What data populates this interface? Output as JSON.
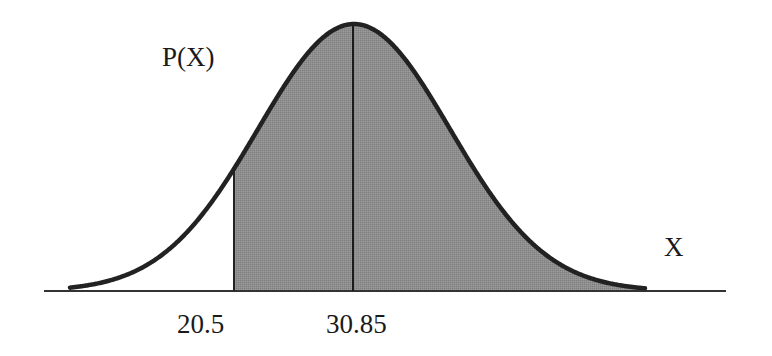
{
  "chart_data": {
    "type": "area",
    "title": "",
    "ylabel": "P(X)",
    "xlabel": "X",
    "distribution": "normal",
    "mean": 30.85,
    "markers": [
      {
        "x": 20.5,
        "label": "20.5",
        "role": "shading-boundary"
      },
      {
        "x": 30.85,
        "label": "30.85",
        "role": "mean"
      }
    ],
    "shaded_region": {
      "from": 20.5,
      "to": "right tail",
      "color": "#8c8c8c"
    },
    "grid": false,
    "legend": null
  },
  "labels": {
    "y_axis": "P(X)",
    "x_axis": "X",
    "tick_left": "20.5",
    "tick_mean": "30.85"
  },
  "colors": {
    "curve": "#222222",
    "shade": "#8c8c8c",
    "axis": "#333333",
    "background": "#ffffff"
  },
  "geometry": {
    "axis_y": 291,
    "axis_x_start": 44,
    "axis_x_end": 726,
    "curve_x_start": 70,
    "curve_x_end": 645,
    "peak_x": 354,
    "peak_y": 24,
    "sigma_px": 96,
    "boundary_x": 234,
    "mean_x": 353
  }
}
